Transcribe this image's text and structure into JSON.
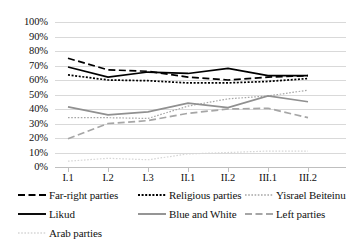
{
  "chart_data": {
    "type": "line",
    "title": "",
    "xlabel": "",
    "ylabel": "",
    "ylim": [
      0,
      100
    ],
    "grid": true,
    "legend_position": "bottom",
    "categories": [
      "I.1",
      "I.2",
      "I.3",
      "II.1",
      "II.2",
      "III.1",
      "III.2"
    ],
    "ytick_labels": [
      "100%",
      "90%",
      "80%",
      "70%",
      "60%",
      "50%",
      "40%",
      "30%",
      "20%",
      "10%",
      "0%"
    ],
    "ytick_values": [
      100,
      90,
      80,
      70,
      60,
      50,
      40,
      30,
      20,
      10,
      0
    ],
    "series": [
      {
        "name": "Far-right parties",
        "values": [
          75,
          67,
          66,
          62,
          60,
          62,
          63
        ],
        "color": "#000000",
        "style": "dashed"
      },
      {
        "name": "Religious parties",
        "values": [
          63.5,
          60,
          59.5,
          58,
          58,
          59,
          61
        ],
        "color": "#000000",
        "style": "dotted-dense"
      },
      {
        "name": "Yisrael Beiteinu",
        "values": [
          34,
          34,
          33.5,
          42,
          47,
          49,
          53
        ],
        "color": "#a6a6a6",
        "style": "dotted-fine"
      },
      {
        "name": "Likud",
        "values": [
          69,
          62,
          65.5,
          64.5,
          68,
          63,
          63
        ],
        "color": "#000000",
        "style": "solid"
      },
      {
        "name": "Blue and White",
        "values": [
          41.5,
          36,
          38,
          44,
          41,
          49,
          45
        ],
        "color": "#909090",
        "style": "solid"
      },
      {
        "name": "Left parties",
        "values": [
          19.5,
          30,
          32,
          37,
          40,
          40.5,
          34
        ],
        "color": "#a6a6a6",
        "style": "dashed"
      },
      {
        "name": "Arab parties",
        "values": [
          4,
          6,
          5,
          9,
          10,
          11,
          11
        ],
        "color": "#d6d6d6",
        "style": "dotted-fine"
      }
    ]
  },
  "legend": {
    "items": [
      {
        "label": "Far-right parties"
      },
      {
        "label": "Religious parties"
      },
      {
        "label": "Yisrael Beiteinu"
      },
      {
        "label": "Likud"
      },
      {
        "label": "Blue and White"
      },
      {
        "label": "Left parties"
      },
      {
        "label": "Arab parties"
      }
    ]
  }
}
